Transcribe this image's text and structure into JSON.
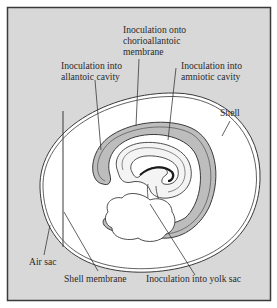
{
  "figure": {
    "type": "diagram",
    "colors": {
      "frame_background": "#d8d8d8",
      "frame_border": "#3a3a3a",
      "egg_interior": "#ffffff",
      "membrane_fill": "#bdbdbd",
      "line": "#3a3a3a"
    }
  },
  "labels": {
    "chorioallantoic": [
      "Inoculation onto",
      "chorioallantoic",
      "membrane"
    ],
    "allantoic": [
      "Inoculation into",
      "allantoic cavity"
    ],
    "amniotic": [
      "Inoculation into",
      "amniotic cavity"
    ],
    "shell": "Shell",
    "air_sac": "Air sac",
    "shell_membrane": "Shell membrane",
    "yolk_sac": "Inoculation into yolk sac"
  }
}
